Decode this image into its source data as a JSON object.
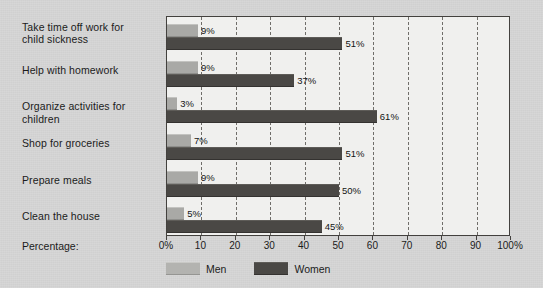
{
  "axis_caption": "Percentage:",
  "legend": {
    "position": "bottom",
    "items": [
      {
        "label": "Men",
        "color": "#b3b3b0"
      },
      {
        "label": "Women",
        "color": "#4a4845"
      }
    ]
  },
  "chart_data": {
    "type": "bar",
    "orientation": "horizontal",
    "title": "",
    "xlabel": "Percentage:",
    "ylabel": "",
    "xlim": [
      0,
      100
    ],
    "grid": true,
    "grid_axis": "x",
    "legend_position": "bottom",
    "tick_labels": [
      "0%",
      "10",
      "20",
      "30",
      "40",
      "50",
      "60",
      "70",
      "80",
      "90",
      "100%"
    ],
    "tick_values": [
      0,
      10,
      20,
      30,
      40,
      50,
      60,
      70,
      80,
      90,
      100
    ],
    "categories": [
      "Take time off work for child sickness",
      "Help with homework",
      "Organize activities for children",
      "Shop for groceries",
      "Prepare meals",
      "Clean the house"
    ],
    "series": [
      {
        "name": "Men",
        "color": "#a9a9a6",
        "values": [
          9,
          9,
          3,
          7,
          9,
          5
        ],
        "value_labels": [
          "9%",
          "9%",
          "3%",
          "7%",
          "9%",
          "5%"
        ]
      },
      {
        "name": "Women",
        "color": "#4a4845",
        "values": [
          51,
          37,
          61,
          51,
          50,
          45
        ],
        "value_labels": [
          "51%",
          "37%",
          "61%",
          "51%",
          "50%",
          "45%"
        ]
      }
    ]
  },
  "category_label_lines": [
    [
      "Take time off work for",
      "child sickness"
    ],
    [
      "Help with homework"
    ],
    [
      "Organize activities for children"
    ],
    [
      "Shop for groceries"
    ],
    [
      "Prepare meals"
    ],
    [
      "Clean the house"
    ]
  ]
}
